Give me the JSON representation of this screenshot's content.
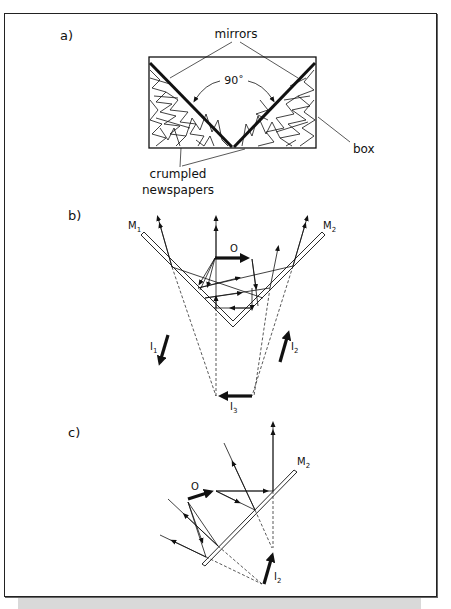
{
  "figure": {
    "panels": [
      {
        "id": "a",
        "label": "a)",
        "annotations": {
          "mirrors": "mirrors",
          "angle": "90˚",
          "box": "box",
          "newspapers_line1": "crumpled",
          "newspapers_line2": "newspapers"
        }
      },
      {
        "id": "b",
        "label": "b)",
        "annotations": {
          "mirror1": "M",
          "mirror1_sub": "1",
          "mirror2": "M",
          "mirror2_sub": "2",
          "object": "O",
          "image1": "I",
          "image1_sub": "1",
          "image2": "I",
          "image2_sub": "2",
          "image3": "I",
          "image3_sub": "3"
        }
      },
      {
        "id": "c",
        "label": "c)",
        "annotations": {
          "mirror2": "M",
          "mirror2_sub": "2",
          "object": "O",
          "image2": "I",
          "image2_sub": "2"
        }
      }
    ],
    "colors": {
      "ink": "#111111",
      "frame": "#222222",
      "shadow": "#d9d9d9",
      "background": "#ffffff"
    }
  }
}
